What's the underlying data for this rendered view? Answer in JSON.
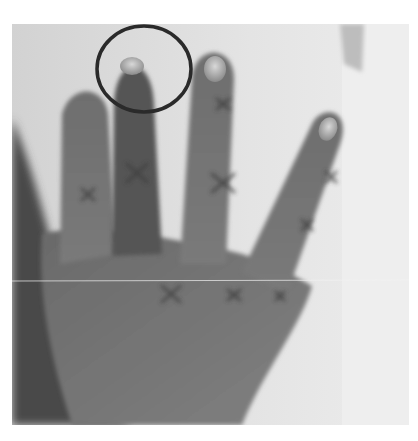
{
  "figure": {
    "kind": "grayscale clinical photograph",
    "annotations": {
      "circle": {
        "label": "highlighted fingertip",
        "shape": "ellipse",
        "color": "#2a2a2a"
      },
      "x_marks": {
        "count": 9,
        "color": "#3a3a3a",
        "label": "joint markings"
      }
    },
    "colors": {
      "background": "#e6e6e6",
      "skin_dark": "#5a5a5a",
      "skin_mid": "#7c7c7c",
      "nail_highlight": "#cfcfcf"
    }
  },
  "caption": {
    "text": "",
    "clipped": true
  }
}
